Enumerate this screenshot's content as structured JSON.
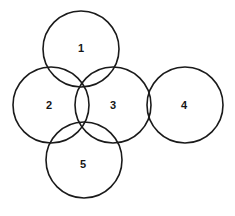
{
  "figure": {
    "background_color": "#ffffff",
    "stroke_color": "#1a1a1a",
    "label_color": "#161616",
    "canvas": {
      "width": 235,
      "height": 216
    }
  },
  "chart_data": {
    "type": "diagram",
    "subtype": "venn-like-circle-arrangement",
    "title": "",
    "xlabel": "",
    "ylabel": "",
    "grid": false,
    "legend": "none",
    "shape": "circle",
    "count": 5,
    "circles": [
      {
        "label": "1",
        "cx": 81,
        "cy": 49,
        "r": 38,
        "label_x": 81,
        "label_y": 48
      },
      {
        "label": "2",
        "cx": 51,
        "cy": 105,
        "r": 38,
        "label_x": 49,
        "label_y": 105
      },
      {
        "label": "3",
        "cx": 113,
        "cy": 105,
        "r": 38,
        "label_x": 113,
        "label_y": 105
      },
      {
        "label": "4",
        "cx": 185,
        "cy": 105,
        "r": 38,
        "label_x": 184,
        "label_y": 105
      },
      {
        "label": "5",
        "cx": 84,
        "cy": 160,
        "r": 38,
        "label_x": 83,
        "label_y": 164
      }
    ],
    "labels": [
      "1",
      "2",
      "3",
      "4",
      "5"
    ]
  }
}
